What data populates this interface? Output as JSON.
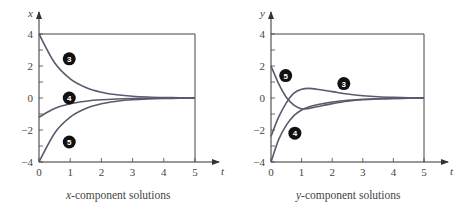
{
  "chart_data": [
    {
      "type": "line",
      "title": "x-component solutions",
      "xlabel": "t",
      "ylabel": "x",
      "xlim": [
        0,
        5
      ],
      "ylim": [
        -4,
        4
      ],
      "xticks": [
        0,
        1,
        2,
        3,
        4,
        5
      ],
      "yticks": [
        -4,
        -2,
        0,
        2,
        4
      ],
      "grid": false,
      "series": [
        {
          "name": "3",
          "x": [
            0,
            0.5,
            1,
            1.5,
            2,
            2.5,
            3,
            3.5,
            4,
            4.5,
            5
          ],
          "values": [
            4,
            2.2,
            1.2,
            0.66,
            0.36,
            0.2,
            0.11,
            0.06,
            0.03,
            0.02,
            0.01
          ]
        },
        {
          "name": "4",
          "x": [
            0,
            0.5,
            1,
            1.5,
            2,
            2.5,
            3,
            3.5,
            4,
            4.5,
            5
          ],
          "values": [
            -1.2,
            -0.66,
            -0.36,
            -0.2,
            -0.11,
            -0.06,
            -0.03,
            -0.02,
            -0.01,
            0,
            0
          ]
        },
        {
          "name": "5",
          "x": [
            0,
            0.5,
            1,
            1.5,
            2,
            2.5,
            3,
            3.5,
            4,
            4.5,
            5
          ],
          "values": [
            -4,
            -2.2,
            -1.2,
            -0.66,
            -0.36,
            -0.2,
            -0.11,
            -0.06,
            -0.03,
            -0.02,
            -0.01
          ]
        }
      ]
    },
    {
      "type": "line",
      "title": "y-component solutions",
      "xlabel": "t",
      "ylabel": "y",
      "xlim": [
        0,
        5
      ],
      "ylim": [
        -4,
        4
      ],
      "xticks": [
        0,
        1,
        2,
        3,
        4,
        5
      ],
      "yticks": [
        -4,
        -2,
        0,
        2,
        4
      ],
      "grid": false,
      "series": [
        {
          "name": "3",
          "x": [
            0,
            0.25,
            0.5,
            0.75,
            1,
            1.25,
            1.5,
            2,
            2.5,
            3,
            3.5,
            4,
            4.5,
            5
          ],
          "values": [
            -2.4,
            -1.2,
            -0.3,
            0.3,
            0.55,
            0.6,
            0.55,
            0.4,
            0.25,
            0.14,
            0.08,
            0.04,
            0.02,
            0.01
          ]
        },
        {
          "name": "4",
          "x": [
            0,
            0.25,
            0.5,
            0.75,
            1,
            1.25,
            1.5,
            2,
            2.5,
            3,
            3.5,
            4,
            4.5,
            5
          ],
          "values": [
            -4,
            -2.6,
            -1.7,
            -1.1,
            -0.75,
            -0.55,
            -0.42,
            -0.25,
            -0.15,
            -0.08,
            -0.05,
            -0.03,
            -0.01,
            0
          ]
        },
        {
          "name": "5",
          "x": [
            0,
            0.25,
            0.5,
            0.75,
            1,
            1.25,
            1.5,
            2,
            2.5,
            3,
            3.5,
            4,
            4.5,
            5
          ],
          "values": [
            2,
            0.9,
            0.05,
            -0.45,
            -0.68,
            -0.65,
            -0.55,
            -0.35,
            -0.2,
            -0.11,
            -0.06,
            -0.03,
            -0.01,
            0
          ]
        }
      ]
    }
  ],
  "plots": [
    {
      "axis_x_name": "t",
      "axis_y_name": "x",
      "caption_var": "x",
      "caption_rest": "-component solutions",
      "ytick_labels": [
        "4",
        "2",
        "0",
        "−2",
        "−4"
      ],
      "xtick_labels": [
        "0",
        "1",
        "2",
        "3",
        "4",
        "5"
      ],
      "badges": [
        {
          "label": "3",
          "t": 0.97,
          "v": 2.45
        },
        {
          "label": "4",
          "t": 0.97,
          "v": 0.0
        },
        {
          "label": "5",
          "t": 0.97,
          "v": -2.75
        }
      ]
    },
    {
      "axis_x_name": "t",
      "axis_y_name": "y",
      "caption_var": "y",
      "caption_rest": "-component solutions",
      "ytick_labels": [
        "4",
        "2",
        "0",
        "−2",
        "−4"
      ],
      "xtick_labels": [
        "0",
        "1",
        "2",
        "3",
        "4",
        "5"
      ],
      "badges": [
        {
          "label": "5",
          "t": 0.48,
          "v": 1.4
        },
        {
          "label": "3",
          "t": 2.38,
          "v": 0.9
        },
        {
          "label": "4",
          "t": 0.78,
          "v": -2.2
        }
      ]
    }
  ],
  "colors": {
    "curve": "#5a5a6e",
    "axis": "#444444",
    "badge": "#111111"
  }
}
